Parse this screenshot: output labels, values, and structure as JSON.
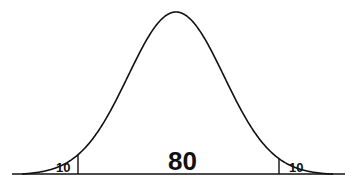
{
  "chart_data": {
    "type": "area",
    "title": "",
    "xlabel": "",
    "ylabel": "",
    "grid": false,
    "legend": null,
    "regions": [
      {
        "name": "left-tail",
        "label": "10",
        "value": 10
      },
      {
        "name": "middle",
        "label": "80",
        "value": 80
      },
      {
        "name": "right-tail",
        "label": "10",
        "value": 10
      }
    ],
    "categories": [
      "Left tail",
      "Middle",
      "Right tail"
    ],
    "values": [
      10,
      80,
      10
    ],
    "colors": {
      "line": "#111111",
      "background": "#ffffff"
    }
  }
}
